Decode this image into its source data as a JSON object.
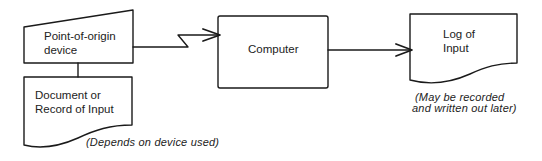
{
  "diagram": {
    "type": "flowchart",
    "nodes": [
      {
        "id": "point_of_origin",
        "shape": "manual-input",
        "lines": [
          "Point-of-origin",
          "device"
        ]
      },
      {
        "id": "document_record",
        "shape": "document",
        "lines": [
          "Document or",
          "Record of Input"
        ],
        "note": "(Depends on device used)"
      },
      {
        "id": "computer",
        "shape": "process",
        "lines": [
          "Computer"
        ]
      },
      {
        "id": "log_of_input",
        "shape": "document",
        "lines": [
          "Log of",
          "Input"
        ],
        "note_lines": [
          "(May be recorded",
          "and written out later)"
        ]
      }
    ],
    "edges": [
      {
        "from": "point_of_origin",
        "to": "document_record",
        "style": "line"
      },
      {
        "from": "point_of_origin",
        "to": "computer",
        "style": "communication-link-arrow"
      },
      {
        "from": "computer",
        "to": "log_of_input",
        "style": "arrow"
      }
    ]
  },
  "labels": {
    "origin_line1": "Point-of-origin",
    "origin_line2": "device",
    "doc_line1": "Document or",
    "doc_line2": "Record of Input",
    "doc_note": "(Depends on device used)",
    "computer": "Computer",
    "log_line1": "Log of",
    "log_line2": "Input",
    "log_note1": "(May be recorded",
    "log_note2": "and written out later)"
  },
  "colors": {
    "stroke": "#1a1a1a",
    "background": "#ffffff"
  }
}
